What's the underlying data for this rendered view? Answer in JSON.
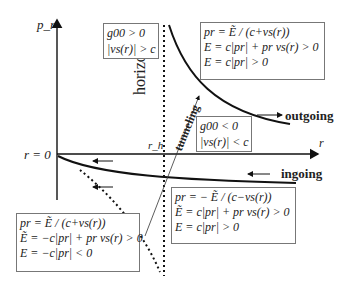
{
  "diagram": {
    "axes": {
      "y_label": "p_r",
      "x_label": "r",
      "origin_label": "r = 0",
      "horizon_label": "horizon",
      "horizon_radius_label": "r_h"
    },
    "labels": {
      "outgoing": "outgoing",
      "ingoing": "ingoing",
      "tunneling": "tunneling"
    },
    "boxes": {
      "outside_region": {
        "lines": [
          "g00 > 0",
          "|vs(r)| > c"
        ]
      },
      "inside_region": {
        "lines": [
          "g00 < 0",
          "|vs(r)| < c"
        ]
      },
      "outgoing_mode": {
        "lines": [
          "pr = Ẽ / (c+vs(r))",
          "E = c|pr| + pr vs(r) > 0",
          "E = c|pr| > 0"
        ]
      },
      "ingoing_mode": {
        "lines": [
          "pr = − Ẽ / (c−vs(r))",
          "Ẽ = c|pr| + pr vs(r) > 0",
          "E = c|pr| > 0"
        ]
      },
      "negative_mode": {
        "lines": [
          "pr = Ẽ / (c+vs(r))",
          "Ẽ = −c|pr| + pr vs(r) > 0",
          "E = −c|pr| < 0"
        ]
      }
    },
    "colors": {
      "line": "#111111",
      "box_border": "#777777",
      "text": "#222222"
    }
  }
}
